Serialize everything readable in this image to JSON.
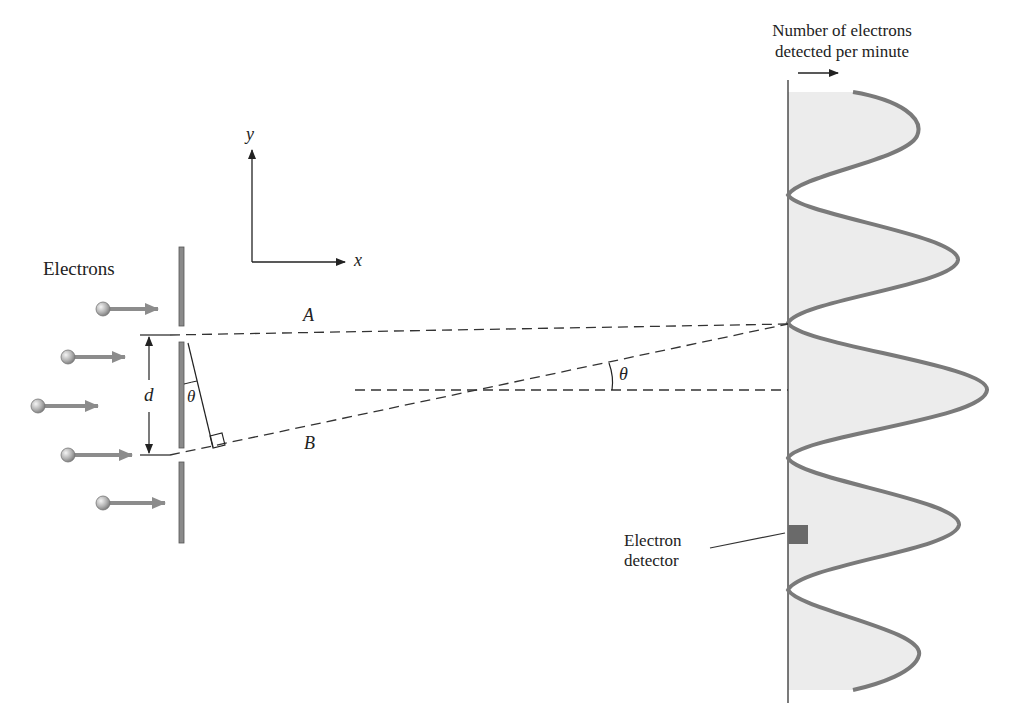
{
  "figure": {
    "type": "double-slit electron interference diagram",
    "labels": {
      "electrons": "Electrons",
      "slit_separation": "d",
      "angle_small": "θ",
      "angle_large": "θ",
      "path_a": "A",
      "path_b": "B",
      "axis_x": "x",
      "axis_y": "y",
      "detector_line1": "Electron",
      "detector_line2": "detector",
      "graph_title_line1": "Number of electrons",
      "graph_title_line2": "detected per minute"
    },
    "colors": {
      "barrier": "#8a8a8a",
      "electron_arrow": "#8c8c8c",
      "curve": "#7a7a7a",
      "shading": "#ececec",
      "detector": "#6a6a6a",
      "lines": "#333333"
    },
    "electrons": [
      {
        "x": 103,
        "y": 309
      },
      {
        "x": 68,
        "y": 357
      },
      {
        "x": 38,
        "y": 406
      },
      {
        "x": 68,
        "y": 455
      },
      {
        "x": 103,
        "y": 503
      }
    ],
    "intensity_pattern": {
      "peaks": [
        {
          "y": 128,
          "x": 917
        },
        {
          "y": 260,
          "x": 958
        },
        {
          "y": 390,
          "x": 987
        },
        {
          "y": 525,
          "x": 959
        },
        {
          "y": 655,
          "x": 919
        }
      ],
      "minima_y": [
        195,
        323,
        458,
        590
      ]
    }
  }
}
